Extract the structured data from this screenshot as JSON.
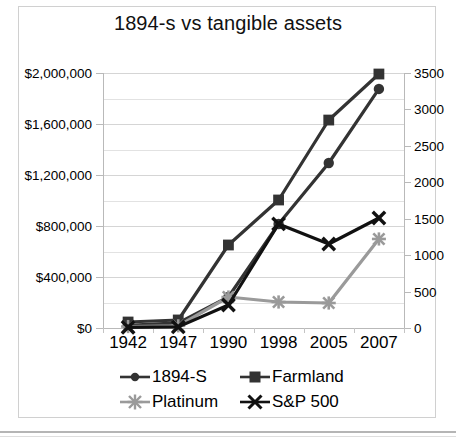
{
  "chart_data": {
    "type": "line",
    "title": "1894-s vs tangible assets",
    "xlabel": "",
    "ylabel": "",
    "categories": [
      "1942",
      "1947",
      "1990",
      "1998",
      "2005",
      "2007"
    ],
    "grid": true,
    "legend_position": "bottom",
    "axes": {
      "left": {
        "ticks": [
          "$0",
          "$400,000",
          "$800,000",
          "$1,200,000",
          "$1,600,000",
          "$2,000,000"
        ],
        "tick_values": [
          0,
          400000,
          800000,
          1200000,
          1600000,
          2000000
        ],
        "ylim": [
          0,
          2000000
        ],
        "minor_step": 200000
      },
      "right": {
        "ticks": [
          "0",
          "500",
          "1000",
          "1500",
          "2000",
          "2500",
          "3000",
          "3500"
        ],
        "tick_values": [
          0,
          500,
          1000,
          1500,
          2000,
          2500,
          3000,
          3500
        ],
        "ylim": [
          0,
          3500
        ]
      }
    },
    "series": [
      {
        "name": "1894-S",
        "axis": "left",
        "marker": "circle",
        "color": "#333333",
        "values": [
          20000,
          40000,
          243000,
          816000,
          1294000,
          1875000
        ]
      },
      {
        "name": "Farmland",
        "axis": "left",
        "marker": "square",
        "color": "#333333",
        "values": [
          47000,
          63000,
          651000,
          1004000,
          1631000,
          1992000
        ]
      },
      {
        "name": "Platinum",
        "axis": "right",
        "marker": "star",
        "color": "#9a9a9a",
        "values": [
          20,
          30,
          425,
          357,
          343,
          1222
        ]
      },
      {
        "name": "S&P 500",
        "axis": "right",
        "marker": "x",
        "color": "#111111",
        "values": [
          10,
          15,
          316,
          1428,
          1153,
          1510
        ]
      }
    ]
  },
  "legend": {
    "items": [
      {
        "label": "1894-S",
        "marker": "circle-marker",
        "color": "#333333"
      },
      {
        "label": "Farmland",
        "marker": "square-marker",
        "color": "#333333"
      },
      {
        "label": "Platinum",
        "marker": "star-marker",
        "color": "#9a9a9a"
      },
      {
        "label": "S&P 500",
        "marker": "x-marker",
        "color": "#111111"
      }
    ]
  }
}
